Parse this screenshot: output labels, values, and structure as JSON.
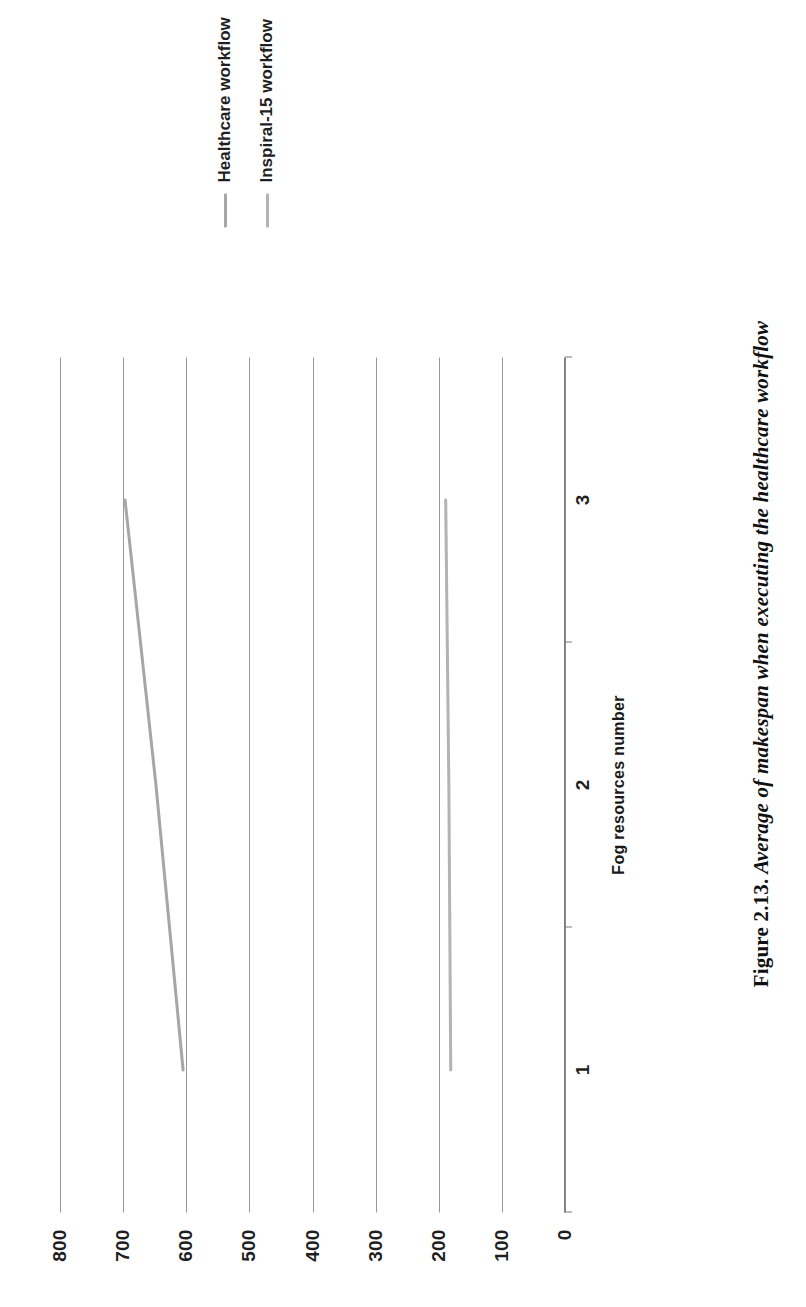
{
  "caption": {
    "number": "Figure 2.13.",
    "text": "Average of makespan when executing the healthcare workflow",
    "full": "Figure 2.13. Average of makespan when executing the healthcare workflow"
  },
  "axis": {
    "x_title": "Fog resources number",
    "y_title": ""
  },
  "legend": {
    "position": "right",
    "items": [
      {
        "label": "Healthcare workflow",
        "color": "#a6a6a6"
      },
      {
        "label": "Inspiral-15 workflow",
        "color": "#b3b3b3"
      }
    ]
  },
  "chart_data": {
    "type": "line",
    "title": "",
    "subtitle": "",
    "xlabel": "Fog resources number",
    "ylabel": "",
    "categories": [
      "1",
      "2",
      "3"
    ],
    "x": [
      1,
      2,
      3
    ],
    "xlim": [
      0.5,
      3.5
    ],
    "ylim": [
      0,
      800
    ],
    "yticks": [
      0,
      100,
      200,
      300,
      400,
      500,
      600,
      700,
      800
    ],
    "ytick_labels": [
      "0",
      "100",
      "200",
      "300",
      "400",
      "500",
      "600",
      "700",
      "800"
    ],
    "grid": true,
    "grid_axis": "y",
    "rotation": "page rotated 90 degrees (landscape figure on portrait page)",
    "series": [
      {
        "name": "Healthcare workflow",
        "color": "#a6a6a6",
        "values": [
          605,
          648,
          697
        ]
      },
      {
        "name": "Inspiral-15 workflow",
        "color": "#b3b3b3",
        "values": [
          181,
          184,
          189
        ]
      }
    ],
    "annotations": []
  }
}
